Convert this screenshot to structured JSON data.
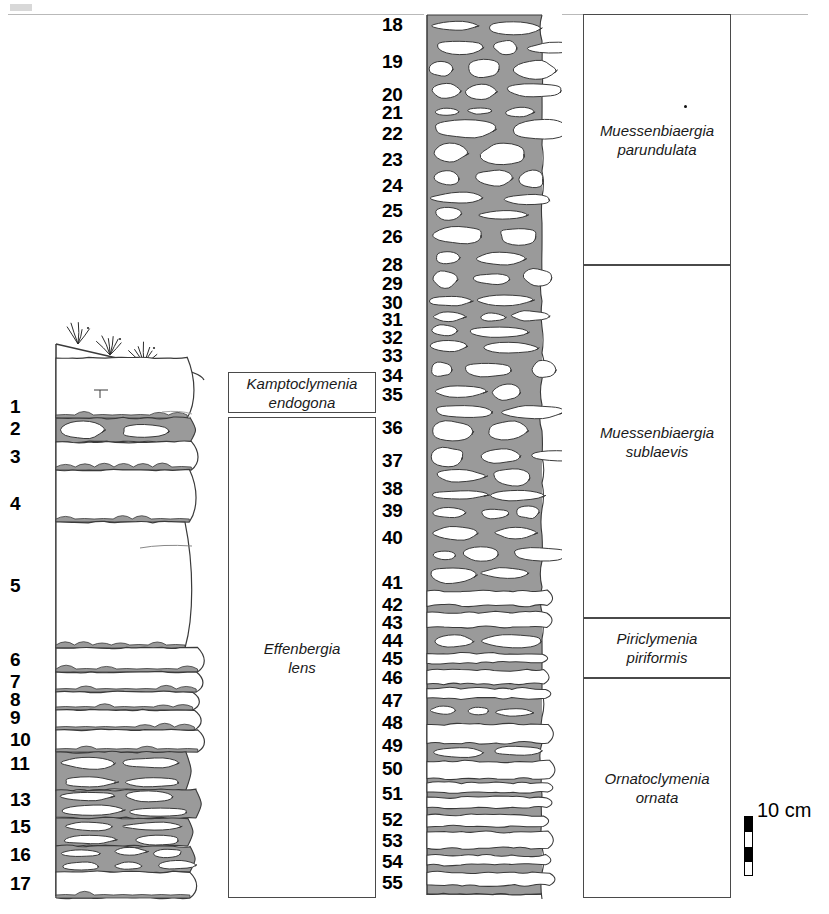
{
  "figure": {
    "type": "stratigraphic-log"
  },
  "header": {
    "rule_visible": true,
    "corner_mark_visible": true
  },
  "left_column": {
    "name": "lower-section-log",
    "top_ornament": "grass-tufts",
    "bed_numbers": [
      "1",
      "2",
      "3",
      "4",
      "5",
      "6",
      "7",
      "8",
      "9",
      "10",
      "11",
      "13",
      "15",
      "16",
      "17"
    ],
    "bed_number_y": [
      407,
      429,
      457,
      504,
      586,
      660,
      682,
      700,
      718,
      740,
      764,
      800,
      827,
      855,
      884
    ],
    "beds": [
      {
        "label": "1",
        "top": 358,
        "bottom": 418,
        "nodular": false
      },
      {
        "label": "2",
        "top": 418,
        "bottom": 442,
        "nodular": true
      },
      {
        "label": "3",
        "top": 442,
        "bottom": 470,
        "nodular": false
      },
      {
        "label": "4",
        "top": 470,
        "bottom": 522,
        "nodular": false
      },
      {
        "label": "5",
        "top": 522,
        "bottom": 648,
        "nodular": false
      },
      {
        "label": "6",
        "top": 648,
        "bottom": 672,
        "nodular": false
      },
      {
        "label": "7",
        "top": 672,
        "bottom": 692,
        "nodular": false
      },
      {
        "label": "8",
        "top": 692,
        "bottom": 710,
        "nodular": false
      },
      {
        "label": "9",
        "top": 710,
        "bottom": 730,
        "nodular": false
      },
      {
        "label": "10",
        "top": 730,
        "bottom": 752,
        "nodular": false
      },
      {
        "label": "11",
        "top": 752,
        "bottom": 790,
        "nodular": true
      },
      {
        "label": "13",
        "top": 790,
        "bottom": 818,
        "nodular": true
      },
      {
        "label": "15",
        "top": 818,
        "bottom": 846,
        "nodular": true
      },
      {
        "label": "16",
        "top": 846,
        "bottom": 872,
        "nodular": true
      },
      {
        "label": "17",
        "top": 872,
        "bottom": 898,
        "nodular": false
      }
    ]
  },
  "right_column": {
    "name": "upper-section-log",
    "bed_numbers": [
      "18",
      "19",
      "20",
      "21",
      "22",
      "23",
      "24",
      "25",
      "26",
      "28",
      "29",
      "30",
      "31",
      "32",
      "33",
      "34",
      "35",
      "36",
      "37",
      "38",
      "39",
      "40",
      "41",
      "42",
      "43",
      "44",
      "45",
      "46",
      "47",
      "48",
      "49",
      "50",
      "51",
      "52",
      "53",
      "54",
      "55"
    ],
    "bed_number_y": [
      25,
      62,
      95,
      113,
      134,
      160,
      186,
      211,
      237,
      265,
      284,
      303,
      320,
      338,
      356,
      376,
      395,
      428,
      461,
      489,
      511,
      538,
      583,
      605,
      623,
      641,
      659,
      678,
      701,
      723,
      746,
      769,
      794,
      820,
      841,
      862,
      883
    ]
  },
  "taxa_left": [
    {
      "name": "kamptoclymenia-endogona",
      "genus": "Kamptoclymenia",
      "species": "endogona",
      "top": 372,
      "bottom": 413
    },
    {
      "name": "effenbergia-lens",
      "genus": "Effenbergia",
      "species": "lens",
      "top": 417,
      "bottom": 898
    }
  ],
  "taxa_right": [
    {
      "name": "muessenbiaergia-parundulata",
      "genus": "Muessenbiaergia",
      "species": "parundulata",
      "top": 14,
      "bottom": 265
    },
    {
      "name": "muessenbiaergia-sublaevis",
      "genus": "Muessenbiaergia",
      "species": "sublaevis",
      "top": 265,
      "bottom": 618
    },
    {
      "name": "piriclymenia-piriformis",
      "genus": "Piriclymenia",
      "species": "piriformis",
      "top": 618,
      "bottom": 678
    },
    {
      "name": "ornatoclymenia-ornata",
      "genus": "Ornatoclymenia",
      "species": "ornata",
      "top": 678,
      "bottom": 898
    }
  ],
  "scale": {
    "label": "10 cm",
    "bar_segments": 4,
    "bar_height": 60
  },
  "colors": {
    "marl_gray": "#9a9a9a",
    "limestone_white": "#ffffff",
    "outline": "#3a3a3a",
    "text": "#000000",
    "box_border": "#4a4a4a"
  }
}
